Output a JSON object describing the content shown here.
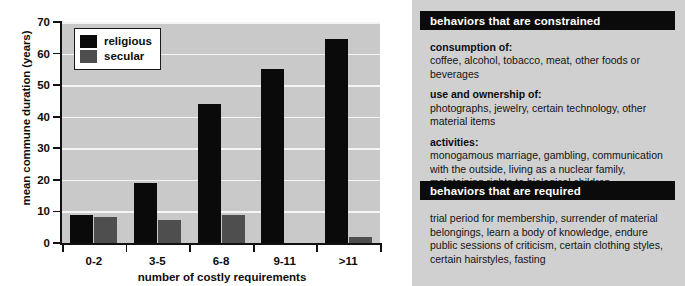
{
  "chart_data": {
    "type": "bar",
    "title": "",
    "xlabel": "number of costly requirements",
    "ylabel": "mean commune duration (years)",
    "categories": [
      "0-2",
      "3-5",
      "6-8",
      "9-11",
      ">11"
    ],
    "series": [
      {
        "name": "religious",
        "color": "#0a0a0a",
        "values": [
          9,
          19,
          44,
          55,
          64.5
        ]
      },
      {
        "name": "secular",
        "color": "#4e4e4e",
        "values": [
          8.3,
          7.2,
          9,
          0,
          2
        ]
      }
    ],
    "ylim": [
      0,
      70
    ],
    "yticks": [
      0,
      10,
      20,
      30,
      40,
      50,
      60,
      70
    ],
    "ytick_labels": [
      "0",
      "10",
      "20",
      "30",
      "40",
      "50",
      "60",
      "70"
    ],
    "grid": true,
    "grid_axis": "y",
    "legend_position": "upper left",
    "plot_background": "#c9c9c9",
    "gridline_color": "#f4f4f4"
  },
  "legend": {
    "items": [
      {
        "label": "religious",
        "color": "#0a0a0a"
      },
      {
        "label": "secular",
        "color": "#4e4e4e"
      }
    ]
  },
  "info_panel": {
    "background": "#d0d0d0",
    "constrained": {
      "header": "behaviors that are constrained",
      "groups": [
        {
          "head": "consumption of:",
          "body": "coffee, alcohol, tobacco, meat, other foods or beverages"
        },
        {
          "head": "use and ownership of:",
          "body": "photographs, jewelry, certain technology, other material items"
        },
        {
          "head": "activities:",
          "body": "monogamous marriage, gambling, communication with the outside, living as a nuclear family, maintaining rights to biological children"
        }
      ]
    },
    "required": {
      "header": "behaviors that are required",
      "body": "trial period for membership, surrender of material belongings, learn a body of knowledge, endure public sessions of criticism, certain clothing styles, certain hairstyles, fasting"
    }
  }
}
